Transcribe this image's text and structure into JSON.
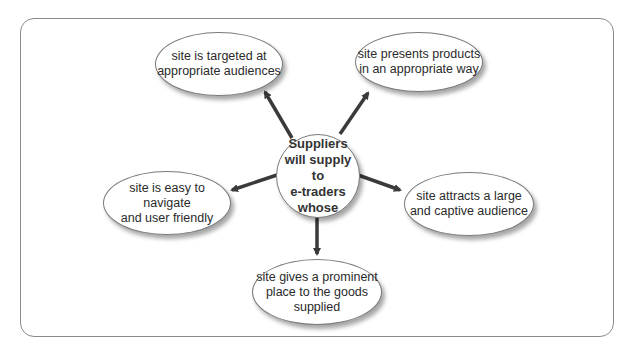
{
  "diagram": {
    "center": {
      "label": "Suppliers\nwill supply to\ne-traders\nwhose"
    },
    "nodes": [
      {
        "id": "top-left",
        "label": "site is targeted at\nappropriate audiences"
      },
      {
        "id": "top-right",
        "label": "site presents products\nin an appropriate way"
      },
      {
        "id": "left",
        "label": "site is easy to navigate\nand user friendly"
      },
      {
        "id": "right",
        "label": "site attracts a large\nand captive audience"
      },
      {
        "id": "bottom",
        "label": "site gives a prominent\nplace to the goods\nsupplied"
      }
    ],
    "colors": {
      "arrow": "#3a3a3a",
      "border": "#7a7a7a",
      "frame": "#8a8a8a"
    }
  }
}
